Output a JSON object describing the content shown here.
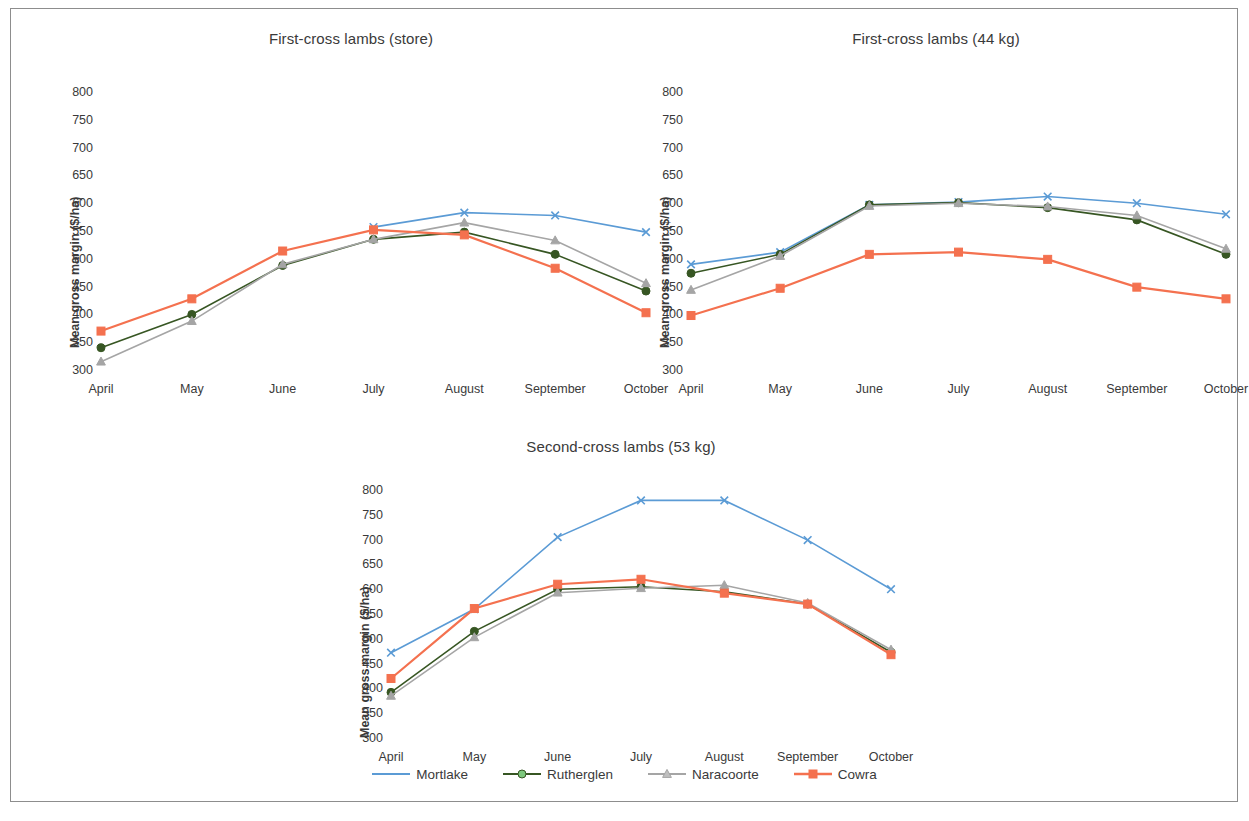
{
  "figure": {
    "border_color": "#8d8d8d",
    "background": "#ffffff"
  },
  "axis": {
    "ylabel": "Mean gross margin ($/ha)",
    "yticks": [
      "300",
      "350",
      "400",
      "450",
      "500",
      "550",
      "600",
      "650",
      "700",
      "750",
      "800"
    ],
    "xticks": [
      "April",
      "May",
      "June",
      "July",
      "August",
      "September",
      "October"
    ]
  },
  "legend": {
    "items": [
      {
        "label": "Mortlake",
        "color": "#5B9BD5",
        "marker": "x-marker"
      },
      {
        "label": "Rutherglen",
        "color": "#375623",
        "marker": "circle-marker",
        "marker_fill": "#7DC87D"
      },
      {
        "label": "Naracoorte",
        "color": "#A5A5A5",
        "marker": "triangle-marker",
        "marker_fill": "#BFBFBF"
      },
      {
        "label": "Cowra",
        "color": "#F4714F",
        "marker": "square-marker",
        "marker_fill": "#F4714F"
      }
    ]
  },
  "panels": [
    {
      "id": "first-cross-store",
      "title": "First-cross lambs (store)"
    },
    {
      "id": "first-cross-44kg",
      "title": "First-cross lambs (44 kg)"
    },
    {
      "id": "second-cross-53kg",
      "title": "Second-cross lambs (53 kg)"
    }
  ],
  "chart_data": [
    {
      "type": "line",
      "title": "First-cross lambs (store)",
      "xlabel": "",
      "ylabel": "Mean gross margin ($/ha)",
      "categories": [
        "April",
        "May",
        "June",
        "July",
        "August",
        "September",
        "October"
      ],
      "ylim": [
        300,
        800
      ],
      "ytick_step": 50,
      "grid": false,
      "legend_position": "bottom-shared",
      "series": [
        {
          "name": "Mortlake",
          "color": "#5B9BD5",
          "marker": "x-marker",
          "values": [
            null,
            null,
            null,
            557,
            583,
            578,
            548
          ]
        },
        {
          "name": "Rutherglen",
          "color": "#375623",
          "marker": "circle-marker",
          "values": [
            340,
            400,
            488,
            535,
            548,
            508,
            442
          ]
        },
        {
          "name": "Naracoorte",
          "color": "#A5A5A5",
          "marker": "triangle-marker",
          "values": [
            315,
            388,
            490,
            535,
            565,
            533,
            456
          ]
        },
        {
          "name": "Cowra",
          "color": "#F4714F",
          "marker": "square-marker",
          "values": [
            370,
            428,
            514,
            552,
            543,
            483,
            403
          ]
        }
      ]
    },
    {
      "type": "line",
      "title": "First-cross lambs (44 kg)",
      "xlabel": "",
      "ylabel": "Mean gross margin ($/ha)",
      "categories": [
        "April",
        "May",
        "June",
        "July",
        "August",
        "September",
        "October"
      ],
      "ylim": [
        300,
        800
      ],
      "ytick_step": 50,
      "grid": false,
      "legend_position": "bottom-shared",
      "series": [
        {
          "name": "Mortlake",
          "color": "#5B9BD5",
          "marker": "x-marker",
          "values": [
            490,
            512,
            597,
            602,
            612,
            600,
            580
          ]
        },
        {
          "name": "Rutherglen",
          "color": "#375623",
          "marker": "circle-marker",
          "values": [
            474,
            508,
            597,
            601,
            592,
            570,
            508
          ]
        },
        {
          "name": "Naracoorte",
          "color": "#A5A5A5",
          "marker": "triangle-marker",
          "values": [
            444,
            505,
            595,
            600,
            594,
            578,
            518
          ]
        },
        {
          "name": "Cowra",
          "color": "#F4714F",
          "marker": "square-marker",
          "values": [
            398,
            447,
            508,
            512,
            499,
            449,
            428
          ]
        }
      ]
    },
    {
      "type": "line",
      "title": "Second-cross lambs (53 kg)",
      "xlabel": "",
      "ylabel": "Mean gross margin ($/ha)",
      "categories": [
        "April",
        "May",
        "June",
        "July",
        "August",
        "September",
        "October"
      ],
      "ylim": [
        300,
        800
      ],
      "ytick_step": 50,
      "grid": false,
      "legend_position": "bottom-shared",
      "series": [
        {
          "name": "Mortlake",
          "color": "#5B9BD5",
          "marker": "x-marker",
          "values": [
            472,
            560,
            705,
            779,
            779,
            699,
            600
          ]
        },
        {
          "name": "Rutherglen",
          "color": "#375623",
          "marker": "circle-marker",
          "values": [
            392,
            515,
            600,
            605,
            595,
            570,
            473
          ]
        },
        {
          "name": "Naracoorte",
          "color": "#A5A5A5",
          "marker": "triangle-marker",
          "values": [
            385,
            503,
            593,
            602,
            608,
            572,
            478
          ]
        },
        {
          "name": "Cowra",
          "color": "#F4714F",
          "marker": "square-marker",
          "values": [
            420,
            561,
            610,
            620,
            592,
            570,
            468
          ]
        }
      ]
    }
  ]
}
